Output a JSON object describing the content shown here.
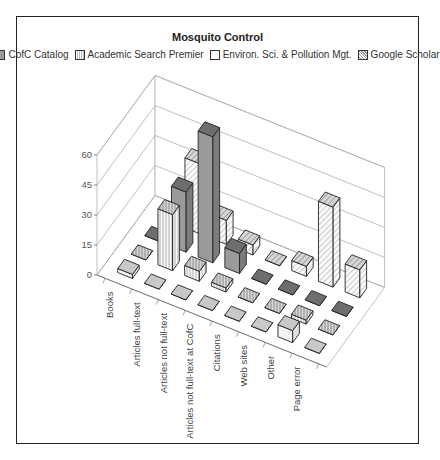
{
  "chart_data": {
    "type": "bar",
    "subtype": "3d-column",
    "title": "Mosquito Control",
    "xlabel": "",
    "ylabel": "",
    "ylim": [
      0,
      60
    ],
    "yticks": [
      "0",
      "15",
      "30",
      "45",
      "60"
    ],
    "grid": true,
    "legend_position": "top",
    "categories": [
      "Books",
      "Articles full-text",
      "Articles not full-text",
      "Articles not full-text at CofC",
      "Citations",
      "Web sites",
      "Other",
      "Page error"
    ],
    "series": [
      {
        "name": "CofC Catalog",
        "values": [
          0,
          30,
          63,
          10,
          0,
          0,
          0,
          0
        ],
        "pattern": "solid-gray"
      },
      {
        "name": "Academic Search Premier",
        "values": [
          0,
          28,
          5,
          2,
          0,
          0,
          2,
          0
        ],
        "pattern": "vertical-lines"
      },
      {
        "name": "Environ. Sci. & Pollution Mgt.",
        "values": [
          2,
          0,
          0,
          0,
          0,
          0,
          6,
          0
        ],
        "pattern": "white"
      },
      {
        "name": "Google Scholar",
        "values": [
          1,
          35,
          12,
          5,
          0,
          5,
          40,
          14
        ],
        "pattern": "diagonal-hatch"
      }
    ]
  },
  "colors": {
    "cofc_side": "#9a9a9a",
    "cofc_top": "#6e6e6e",
    "white_side": "#f4f4f4",
    "white_top": "#c8c8c8",
    "outline": "#222222",
    "grid": "#b0b0b0"
  }
}
